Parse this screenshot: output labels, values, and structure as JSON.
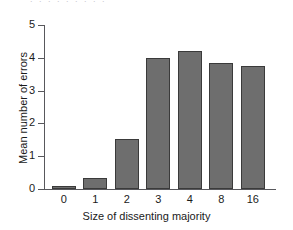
{
  "ghost_text": ". . .       . .       . .       . .",
  "chart_data": {
    "type": "bar",
    "title": "",
    "xlabel": "Size of dissenting majority",
    "ylabel": "Mean number of errors",
    "categories": [
      "0",
      "1",
      "2",
      "3",
      "4",
      "8",
      "16"
    ],
    "values": [
      0.08,
      0.33,
      1.52,
      4.0,
      4.2,
      3.85,
      3.75
    ],
    "series": [
      {
        "name": "Mean number of errors",
        "values": [
          0.08,
          0.33,
          1.52,
          4.0,
          4.2,
          3.85,
          3.75
        ]
      }
    ],
    "ylim": [
      0,
      5
    ],
    "yticks": [
      "0",
      "1",
      "2",
      "3",
      "4",
      "5"
    ],
    "ytick_values": [
      0,
      1,
      2,
      3,
      4,
      5
    ],
    "grid": false,
    "legend": "none",
    "bar_color": "#6e6e6e",
    "bar_edge_color": "#3a3a3a",
    "background_color": "#ffffff",
    "axis_color": "#58585c"
  }
}
